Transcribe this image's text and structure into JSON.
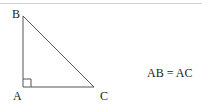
{
  "diagram": {
    "vertices": {
      "A": {
        "label": "A"
      },
      "B": {
        "label": "B"
      },
      "C": {
        "label": "C"
      }
    },
    "right_angle_at": "A",
    "equation": "AB = AC",
    "colors": {
      "stroke": "#555555",
      "text": "#222222",
      "rule": "#d0d0d0"
    }
  }
}
